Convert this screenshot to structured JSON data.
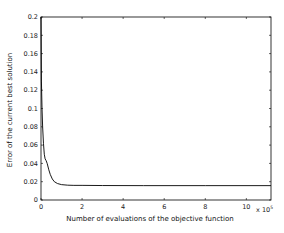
{
  "chart_data": {
    "type": "line",
    "title": "",
    "xlabel": "Number of evaluations of the objective function",
    "ylabel": "Error of the current best solution",
    "x_multiplier_label": "x 10",
    "x_multiplier_exponent": "5",
    "xlim": [
      0,
      11.2
    ],
    "ylim": [
      0,
      0.2
    ],
    "xticks": [
      0,
      2,
      4,
      6,
      8,
      10
    ],
    "xtick_labels": [
      "0",
      "2",
      "4",
      "6",
      "8",
      "10"
    ],
    "yticks": [
      0,
      0.02,
      0.04,
      0.06,
      0.08,
      0.1,
      0.12,
      0.14,
      0.16,
      0.18,
      0.2
    ],
    "ytick_labels": [
      "0",
      "0.02",
      "0.04",
      "0.06",
      "0.08",
      "0.1",
      "0.12",
      "0.14",
      "0.16",
      "0.18",
      "0.2"
    ],
    "grid": false,
    "legend": null,
    "series": [
      {
        "name": "error",
        "color": "#000000",
        "x": [
          0.0,
          0.02,
          0.05,
          0.08,
          0.12,
          0.16,
          0.2,
          0.25,
          0.3,
          0.38,
          0.45,
          0.55,
          0.65,
          0.8,
          1.0,
          1.3,
          1.6,
          2.0,
          3.0,
          5.0,
          8.0,
          11.2
        ],
        "y": [
          0.2,
          0.13,
          0.1,
          0.08,
          0.062,
          0.05,
          0.045,
          0.043,
          0.04,
          0.033,
          0.028,
          0.023,
          0.02,
          0.018,
          0.0168,
          0.0162,
          0.016,
          0.016,
          0.0158,
          0.0157,
          0.0157,
          0.0157
        ]
      }
    ]
  }
}
